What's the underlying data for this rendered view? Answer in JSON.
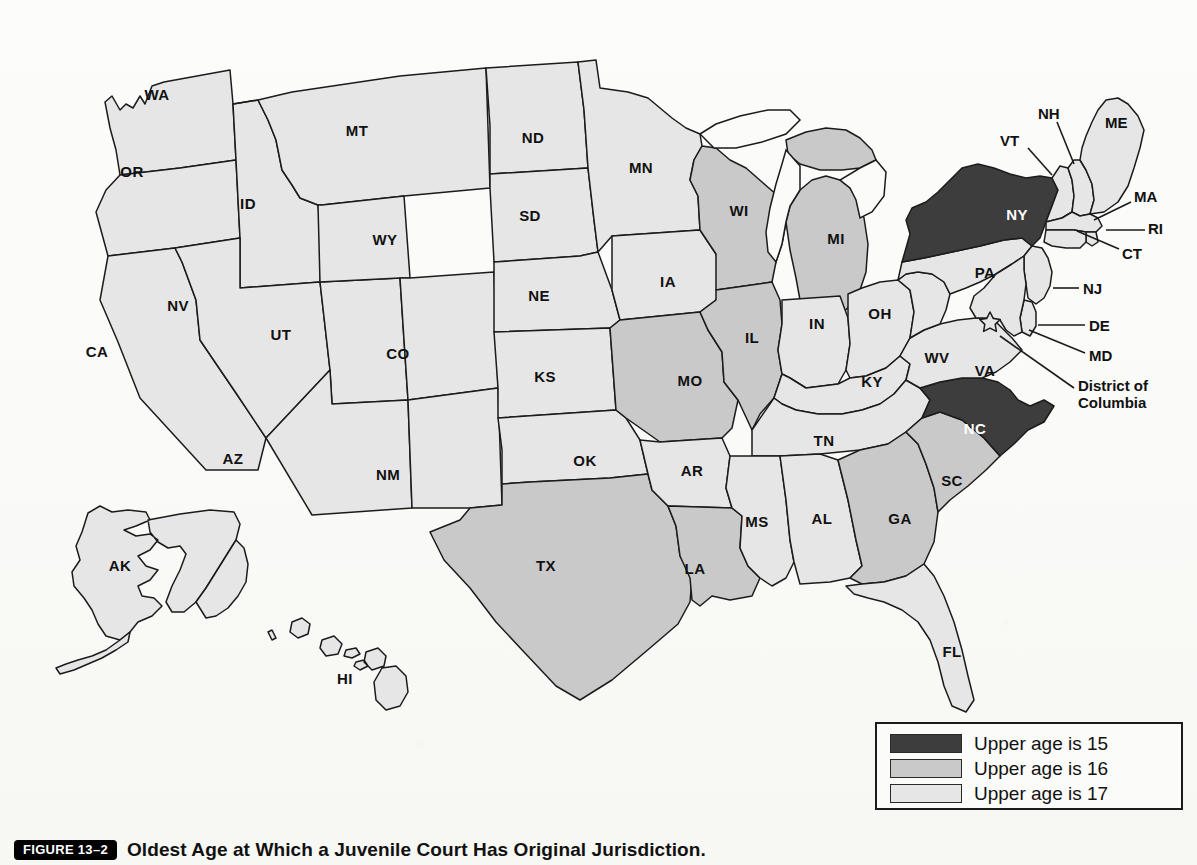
{
  "figure": {
    "badge": "FIGURE 13–2",
    "caption": "Oldest Age at Which a Juvenile Court Has Original Jurisdiction."
  },
  "colors": {
    "age15": "#3d3d3d",
    "age16": "#c9c9c9",
    "age17": "#e6e6e6",
    "outline": "#1b1b1b",
    "background": "#fbfbf9"
  },
  "legend": {
    "items": [
      {
        "label": "Upper age is 15",
        "color": "#3d3d3d",
        "age": 15
      },
      {
        "label": "Upper age is 16",
        "color": "#c9c9c9",
        "age": 16
      },
      {
        "label": "Upper age is 17",
        "color": "#e6e6e6",
        "age": 17
      }
    ]
  },
  "map": {
    "title": "United States choropleth of juvenile court upper age jurisdiction",
    "states": [
      {
        "code": "WA",
        "age": 17
      },
      {
        "code": "OR",
        "age": 17
      },
      {
        "code": "CA",
        "age": 17
      },
      {
        "code": "ID",
        "age": 17
      },
      {
        "code": "NV",
        "age": 17
      },
      {
        "code": "UT",
        "age": 17
      },
      {
        "code": "AZ",
        "age": 17
      },
      {
        "code": "MT",
        "age": 17
      },
      {
        "code": "WY",
        "age": 17
      },
      {
        "code": "CO",
        "age": 17
      },
      {
        "code": "NM",
        "age": 17
      },
      {
        "code": "ND",
        "age": 17
      },
      {
        "code": "SD",
        "age": 17
      },
      {
        "code": "NE",
        "age": 17
      },
      {
        "code": "KS",
        "age": 17
      },
      {
        "code": "OK",
        "age": 17
      },
      {
        "code": "TX",
        "age": 16
      },
      {
        "code": "MN",
        "age": 17
      },
      {
        "code": "IA",
        "age": 17
      },
      {
        "code": "MO",
        "age": 16
      },
      {
        "code": "AR",
        "age": 17
      },
      {
        "code": "LA",
        "age": 16
      },
      {
        "code": "WI",
        "age": 16
      },
      {
        "code": "IL",
        "age": 16
      },
      {
        "code": "MI",
        "age": 16
      },
      {
        "code": "IN",
        "age": 17
      },
      {
        "code": "OH",
        "age": 17
      },
      {
        "code": "KY",
        "age": 17
      },
      {
        "code": "TN",
        "age": 17
      },
      {
        "code": "MS",
        "age": 17
      },
      {
        "code": "AL",
        "age": 17
      },
      {
        "code": "GA",
        "age": 16
      },
      {
        "code": "FL",
        "age": 17
      },
      {
        "code": "SC",
        "age": 16
      },
      {
        "code": "NC",
        "age": 15
      },
      {
        "code": "VA",
        "age": 17
      },
      {
        "code": "WV",
        "age": 17
      },
      {
        "code": "PA",
        "age": 17
      },
      {
        "code": "NY",
        "age": 15
      },
      {
        "code": "VT",
        "age": 17
      },
      {
        "code": "NH",
        "age": 17
      },
      {
        "code": "ME",
        "age": 17
      },
      {
        "code": "MA",
        "age": 17
      },
      {
        "code": "RI",
        "age": 17
      },
      {
        "code": "CT",
        "age": 17
      },
      {
        "code": "NJ",
        "age": 17
      },
      {
        "code": "DE",
        "age": 17
      },
      {
        "code": "MD",
        "age": 17
      },
      {
        "code": "DC",
        "age": 17
      },
      {
        "code": "AK",
        "age": 17
      },
      {
        "code": "HI",
        "age": 17
      }
    ],
    "inline_labels": [
      {
        "code": "WA",
        "text": "WA",
        "x": 157,
        "y": 94,
        "dark": false
      },
      {
        "code": "OR",
        "text": "OR",
        "x": 132,
        "y": 171,
        "dark": false
      },
      {
        "code": "CA",
        "text": "CA",
        "x": 97,
        "y": 351,
        "dark": false
      },
      {
        "code": "ID",
        "text": "ID",
        "x": 248,
        "y": 203,
        "dark": false
      },
      {
        "code": "NV",
        "text": "NV",
        "x": 178,
        "y": 305,
        "dark": false
      },
      {
        "code": "UT",
        "text": "UT",
        "x": 281,
        "y": 334,
        "dark": false
      },
      {
        "code": "AZ",
        "text": "AZ",
        "x": 233,
        "y": 458,
        "dark": false
      },
      {
        "code": "MT",
        "text": "MT",
        "x": 357,
        "y": 130,
        "dark": false
      },
      {
        "code": "WY",
        "text": "WY",
        "x": 385,
        "y": 239,
        "dark": false
      },
      {
        "code": "CO",
        "text": "CO",
        "x": 398,
        "y": 353,
        "dark": false
      },
      {
        "code": "NM",
        "text": "NM",
        "x": 388,
        "y": 474,
        "dark": false
      },
      {
        "code": "ND",
        "text": "ND",
        "x": 533,
        "y": 137,
        "dark": false
      },
      {
        "code": "SD",
        "text": "SD",
        "x": 530,
        "y": 215,
        "dark": false
      },
      {
        "code": "NE",
        "text": "NE",
        "x": 539,
        "y": 295,
        "dark": false
      },
      {
        "code": "KS",
        "text": "KS",
        "x": 545,
        "y": 376,
        "dark": false
      },
      {
        "code": "OK",
        "text": "OK",
        "x": 585,
        "y": 460,
        "dark": false
      },
      {
        "code": "TX",
        "text": "TX",
        "x": 546,
        "y": 565,
        "dark": false
      },
      {
        "code": "MN",
        "text": "MN",
        "x": 641,
        "y": 167,
        "dark": false
      },
      {
        "code": "IA",
        "text": "IA",
        "x": 668,
        "y": 281,
        "dark": false
      },
      {
        "code": "MO",
        "text": "MO",
        "x": 690,
        "y": 380,
        "dark": false
      },
      {
        "code": "AR",
        "text": "AR",
        "x": 692,
        "y": 470,
        "dark": false
      },
      {
        "code": "LA",
        "text": "LA",
        "x": 695,
        "y": 568,
        "dark": false
      },
      {
        "code": "WI",
        "text": "WI",
        "x": 739,
        "y": 210,
        "dark": false
      },
      {
        "code": "IL",
        "text": "IL",
        "x": 752,
        "y": 337,
        "dark": false
      },
      {
        "code": "MI",
        "text": "MI",
        "x": 836,
        "y": 238,
        "dark": false
      },
      {
        "code": "IN",
        "text": "IN",
        "x": 817,
        "y": 323,
        "dark": false
      },
      {
        "code": "OH",
        "text": "OH",
        "x": 880,
        "y": 313,
        "dark": false
      },
      {
        "code": "KY",
        "text": "KY",
        "x": 872,
        "y": 381,
        "dark": false
      },
      {
        "code": "TN",
        "text": "TN",
        "x": 824,
        "y": 440,
        "dark": false
      },
      {
        "code": "MS",
        "text": "MS",
        "x": 757,
        "y": 521,
        "dark": false
      },
      {
        "code": "AL",
        "text": "AL",
        "x": 822,
        "y": 518,
        "dark": false
      },
      {
        "code": "GA",
        "text": "GA",
        "x": 900,
        "y": 518,
        "dark": false
      },
      {
        "code": "FL",
        "text": "FL",
        "x": 952,
        "y": 651,
        "dark": false
      },
      {
        "code": "SC",
        "text": "SC",
        "x": 952,
        "y": 480,
        "dark": false
      },
      {
        "code": "NC",
        "text": "NC",
        "x": 975,
        "y": 428,
        "dark": true
      },
      {
        "code": "VA",
        "text": "VA",
        "x": 985,
        "y": 370,
        "dark": false
      },
      {
        "code": "WV",
        "text": "WV",
        "x": 937,
        "y": 357,
        "dark": false
      },
      {
        "code": "PA",
        "text": "PA",
        "x": 985,
        "y": 272,
        "dark": false
      },
      {
        "code": "NY",
        "text": "NY",
        "x": 1017,
        "y": 214,
        "dark": true
      },
      {
        "code": "AK",
        "text": "AK",
        "x": 120,
        "y": 565,
        "dark": false
      },
      {
        "code": "HI",
        "text": "HI",
        "x": 345,
        "y": 678,
        "dark": false
      }
    ],
    "callout_labels": [
      {
        "code": "VT",
        "text": "VT",
        "x": 1000,
        "y": 140,
        "line": {
          "x1": 1028,
          "y1": 148,
          "x2": 1052,
          "y2": 175
        }
      },
      {
        "code": "NH",
        "text": "NH",
        "x": 1038,
        "y": 113,
        "line": {
          "x1": 1057,
          "y1": 122,
          "x2": 1074,
          "y2": 164
        }
      },
      {
        "code": "ME",
        "text": "ME",
        "x": 1105,
        "y": 122,
        "line": null
      },
      {
        "code": "MA",
        "text": "MA",
        "x": 1134,
        "y": 196,
        "line": {
          "x1": 1131,
          "y1": 202,
          "x2": 1094,
          "y2": 220
        }
      },
      {
        "code": "RI",
        "text": "RI",
        "x": 1148,
        "y": 228,
        "line": {
          "x1": 1145,
          "y1": 230,
          "x2": 1106,
          "y2": 230
        }
      },
      {
        "code": "CT",
        "text": "CT",
        "x": 1122,
        "y": 253,
        "line": {
          "x1": 1119,
          "y1": 249,
          "x2": 1077,
          "y2": 231
        }
      },
      {
        "code": "NJ",
        "text": "NJ",
        "x": 1083,
        "y": 288,
        "line": {
          "x1": 1079,
          "y1": 288,
          "x2": 1053,
          "y2": 288
        }
      },
      {
        "code": "DE",
        "text": "DE",
        "x": 1089,
        "y": 325,
        "line": {
          "x1": 1085,
          "y1": 325,
          "x2": 1038,
          "y2": 325
        }
      },
      {
        "code": "MD",
        "text": "MD",
        "x": 1089,
        "y": 355,
        "line": {
          "x1": 1085,
          "y1": 353,
          "x2": 1029,
          "y2": 330
        }
      },
      {
        "code": "DC",
        "text": "District of Columbia",
        "x": 1078,
        "y": 395,
        "line": {
          "x1": 1074,
          "y1": 388,
          "x2": 1000,
          "y2": 336
        }
      }
    ]
  }
}
